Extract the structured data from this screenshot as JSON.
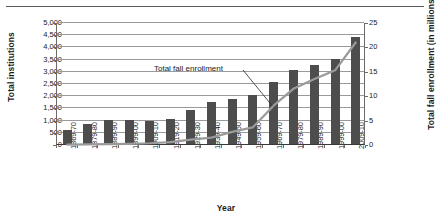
{
  "chart_data": {
    "type": "bar",
    "title": "",
    "categories": [
      "1869-70",
      "1879-80",
      "1889-90",
      "1899-00",
      "1909-10",
      "1919-20",
      "1929-30",
      "1939-40",
      "1949-50",
      "1959-60",
      "1969-70",
      "1979-80",
      "1989-90",
      "1999-00",
      "2009-10"
    ],
    "xlabel": "Year",
    "ylabel": "Total institutions",
    "y2label": "Total fall enrollment (in millions)",
    "ylim": [
      0,
      5000
    ],
    "y2lim": [
      0,
      25
    ],
    "yticks": [
      "0",
      "500",
      "1,000",
      "1,500",
      "2,000",
      "2,500",
      "3,000",
      "3,500",
      "4,000",
      "4,500",
      "5,000"
    ],
    "y2ticks": [
      "0",
      "5",
      "10",
      "15",
      "20",
      "25"
    ],
    "grid": true,
    "legend_position": "none",
    "series": [
      {
        "name": "Total institutions",
        "type": "bar",
        "axis": "left",
        "color": "#4d4d4d",
        "values": [
          560,
          810,
          1000,
          980,
          960,
          1030,
          1410,
          1710,
          1850,
          2000,
          2530,
          3050,
          3230,
          3500,
          4400
        ]
      },
      {
        "name": "Total fall enrollment",
        "type": "line",
        "axis": "right",
        "color": "#9a9a9a",
        "values": [
          0.06,
          0.12,
          0.16,
          0.24,
          0.36,
          0.6,
          1.1,
          1.5,
          2.7,
          3.6,
          8.0,
          11.6,
          13.5,
          15.3,
          21.0
        ]
      }
    ],
    "annotations": [
      {
        "text": "Total fall enrollment",
        "target_category": "1969-70"
      }
    ]
  }
}
